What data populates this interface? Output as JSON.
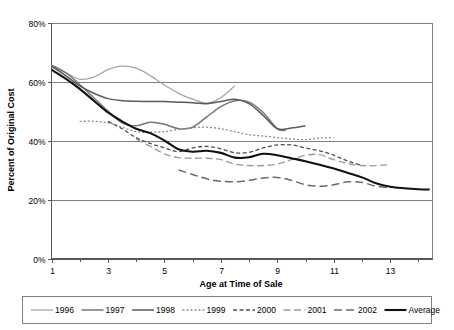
{
  "chart_data": {
    "type": "line",
    "title": "",
    "xlabel": "Age at Time of Sale",
    "ylabel": "Percent of Original Cost",
    "xlim": [
      1,
      14.5
    ],
    "ylim": [
      0,
      80
    ],
    "xticks": [
      "1",
      "3",
      "5",
      "7",
      "9",
      "11",
      "13"
    ],
    "xtick_values": [
      1,
      3,
      5,
      7,
      9,
      11,
      13
    ],
    "yticks": [
      "0%",
      "20%",
      "40%",
      "60%",
      "80%"
    ],
    "ytick_values": [
      0,
      20,
      40,
      60,
      80
    ],
    "grid": "horizontal",
    "legend_position": "bottom",
    "series": [
      {
        "name": "1996",
        "color": "#a6a6a6",
        "width": 1.3,
        "dash": "none",
        "x": [
          1,
          1.5,
          2,
          2.5,
          3,
          3.5,
          4,
          4.5,
          5,
          5.5,
          6,
          6.5,
          7,
          7.5
        ],
        "values": [
          65.0,
          63.0,
          60.8,
          61.5,
          64.0,
          65.2,
          64.5,
          62.0,
          58.8,
          56.0,
          54.0,
          52.7,
          54.5,
          58.6
        ]
      },
      {
        "name": "1997",
        "color": "#767676",
        "width": 1.5,
        "dash": "none",
        "x": [
          1,
          1.5,
          2,
          2.5,
          3,
          3.5,
          4,
          4.5,
          5,
          5.5,
          6,
          6.5,
          7,
          7.5,
          8,
          8.5,
          9,
          9.3
        ],
        "values": [
          65.5,
          63.0,
          59.0,
          54.5,
          50.0,
          46.0,
          45.0,
          46.2,
          45.5,
          44.0,
          44.5,
          48.0,
          51.5,
          53.5,
          53.0,
          49.5,
          44.0,
          43.5
        ]
      },
      {
        "name": "1998",
        "color": "#5a5a5a",
        "width": 1.5,
        "dash": "none",
        "x": [
          1,
          1.5,
          2,
          2.5,
          3,
          3.5,
          4,
          4.5,
          5,
          5.5,
          6,
          6.5,
          7,
          7.5,
          8,
          8.5,
          9,
          9.5,
          10
        ],
        "values": [
          65.2,
          62.0,
          58.5,
          56.0,
          54.2,
          53.5,
          53.3,
          53.2,
          53.2,
          53.0,
          52.8,
          52.5,
          53.2,
          54.0,
          52.5,
          48.5,
          44.0,
          44.2,
          45.0
        ]
      },
      {
        "name": "1999",
        "color": "#8c8c8c",
        "width": 1.3,
        "dash": "2,2",
        "x": [
          2,
          2.5,
          3,
          3.5,
          4,
          4.5,
          5,
          5.5,
          6,
          6.5,
          7,
          7.5,
          8,
          8.5,
          9,
          9.5,
          10,
          10.5,
          11
        ],
        "values": [
          46.5,
          46.5,
          46.0,
          44.5,
          43.0,
          42.8,
          43.0,
          43.8,
          44.3,
          44.5,
          44.0,
          43.0,
          42.0,
          41.5,
          41.0,
          40.5,
          40.3,
          40.8,
          41.0
        ]
      },
      {
        "name": "2000",
        "color": "#4d4d4d",
        "width": 1.3,
        "dash": "4,2.5",
        "x": [
          3,
          3.5,
          4,
          4.5,
          5,
          5.5,
          6,
          6.5,
          7,
          7.5,
          8,
          8.5,
          9,
          9.5,
          10,
          10.5,
          11,
          11.5,
          12
        ],
        "values": [
          46.5,
          44.0,
          41.0,
          39.0,
          37.5,
          36.2,
          37.5,
          38.0,
          37.2,
          35.8,
          36.0,
          37.5,
          38.5,
          38.5,
          37.5,
          36.5,
          35.0,
          33.0,
          31.5
        ]
      },
      {
        "name": "2001",
        "color": "#9c9c9c",
        "width": 1.4,
        "dash": "7,3.5",
        "x": [
          4,
          4.5,
          5,
          5.5,
          6,
          6.5,
          7,
          7.5,
          8,
          8.5,
          9,
          9.5,
          10,
          10.5,
          11,
          11.5,
          12,
          12.5,
          13
        ],
        "values": [
          40.5,
          38.0,
          35.5,
          34.2,
          34.0,
          34.0,
          33.5,
          32.0,
          31.5,
          31.5,
          32.0,
          33.5,
          35.0,
          35.2,
          33.5,
          32.2,
          31.5,
          31.5,
          31.8
        ]
      },
      {
        "name": "2002",
        "color": "#6b6b6b",
        "width": 1.5,
        "dash": "8,4",
        "x": [
          5.5,
          6,
          6.5,
          7,
          7.5,
          8,
          8.5,
          9,
          9.5,
          10,
          10.5,
          11,
          11.5,
          12,
          12.5,
          13
        ],
        "values": [
          30.0,
          28.5,
          27.0,
          26.2,
          26.0,
          26.5,
          27.3,
          27.5,
          26.5,
          25.0,
          24.5,
          25.0,
          26.0,
          25.8,
          24.5,
          24.0
        ]
      },
      {
        "name": "Average",
        "color": "#111111",
        "width": 2.1,
        "dash": "none",
        "x": [
          1,
          1.5,
          2,
          2.5,
          3,
          3.5,
          4,
          4.5,
          5,
          5.5,
          6,
          6.5,
          7,
          7.5,
          8,
          8.5,
          9,
          9.5,
          10,
          10.5,
          11,
          11.5,
          12,
          12.5,
          13,
          13.5,
          14,
          14.4
        ],
        "values": [
          64.0,
          61.0,
          57.5,
          53.5,
          49.5,
          46.5,
          44.0,
          42.5,
          40.0,
          37.0,
          36.2,
          36.5,
          35.8,
          34.2,
          34.3,
          35.5,
          35.0,
          34.0,
          33.0,
          31.8,
          30.5,
          29.0,
          27.5,
          25.5,
          24.3,
          23.8,
          23.5,
          23.4
        ]
      }
    ]
  },
  "legend": {
    "entries": [
      {
        "label": "1996"
      },
      {
        "label": "1997"
      },
      {
        "label": "1998"
      },
      {
        "label": "1999"
      },
      {
        "label": "2000"
      },
      {
        "label": "2001"
      },
      {
        "label": "2002"
      },
      {
        "label": "Average"
      }
    ]
  },
  "colors": {
    "background": "#ffffff",
    "grid": "#808080",
    "axis": "#595959",
    "text": "#000000"
  }
}
